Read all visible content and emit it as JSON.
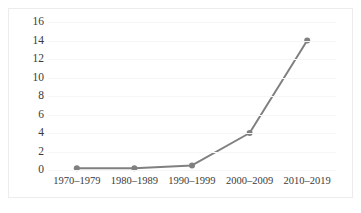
{
  "chart_data": {
    "type": "line",
    "title": "",
    "subtitle": "",
    "xlabel": "",
    "ylabel": "",
    "categories": [
      "1970–1979",
      "1980–1989",
      "1990–1999",
      "2000–2009",
      "2010–2019"
    ],
    "values": [
      0.2,
      0.2,
      0.5,
      4,
      14
    ],
    "series": [
      {
        "name": "",
        "values": [
          0.2,
          0.2,
          0.5,
          4,
          14
        ]
      }
    ],
    "yticks": [
      0,
      2,
      4,
      6,
      8,
      10,
      12,
      14,
      16
    ],
    "ytick_labels": [
      "0",
      "2",
      "4",
      "6",
      "8",
      "10",
      "12",
      "14",
      "16"
    ],
    "ylim": [
      0,
      16
    ],
    "grid": true,
    "grid_axis": "y",
    "legend": false,
    "legend_position": "none",
    "markers": true,
    "colors": {
      "line": "#808080",
      "marker": "#808080",
      "gridline": "#f6f6f6",
      "text": "#3a3a3a",
      "frame": "#ececec",
      "background": "#ffffff"
    }
  }
}
